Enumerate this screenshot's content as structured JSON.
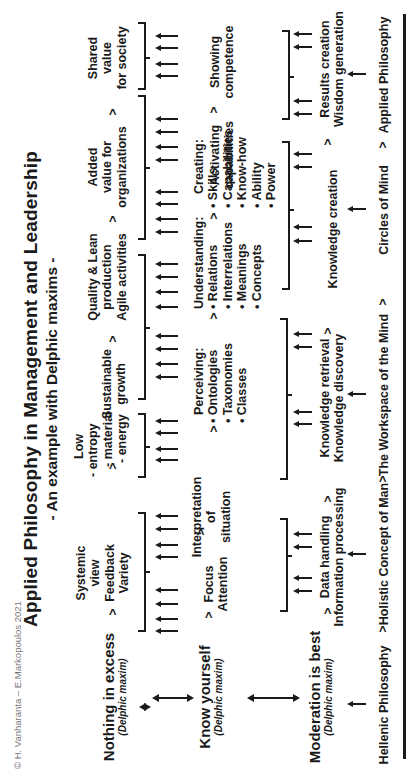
{
  "copyright": "© H. Vanharanta – E.Markopoulos 2021",
  "title": "Applied Philosophy in Management and Leadership",
  "subtitle": "- An example with Delphic maxims -",
  "separator": ">",
  "maxims": [
    {
      "label": "Nothing in excess",
      "sub": "(Delphic maxim)"
    },
    {
      "label": "Know yourself",
      "sub": "(Delphic maxim)"
    },
    {
      "label": "Moderation is best",
      "sub": "(Delphic maxim)"
    }
  ],
  "row1": {
    "items": [
      {
        "lines": [
          "Systemic",
          "view",
          "Feedback",
          "Variety"
        ]
      },
      {
        "lines": [
          "Low",
          "- entropy",
          "- material",
          "- energy"
        ]
      },
      {
        "lines": [
          "Sustainable",
          "growth"
        ]
      },
      {
        "lines": [
          "Quality & Lean",
          "production",
          "Agile activities"
        ]
      },
      {
        "lines": [
          "Added",
          "value for",
          "organizations"
        ]
      },
      {
        "lines": [
          "Shared",
          "value",
          "for society"
        ]
      }
    ]
  },
  "row2": {
    "items": [
      {
        "lines": [
          "Focus",
          "Attention"
        ]
      },
      {
        "lines": [
          "Interpretation",
          "of",
          "situation"
        ]
      },
      {
        "heading": "Perceiving:",
        "bullets": [
          "• Ontologies",
          "• Taxonomies",
          "• Classes"
        ]
      },
      {
        "heading": "Understanding:",
        "bullets": [
          "• Relations",
          "• Interrelations",
          "• Meanings",
          "• Concepts"
        ]
      },
      {
        "heading": "Creating:",
        "bullets": [
          "• Skills",
          "• Capabilities",
          "• Know-how",
          "• Ability",
          "• Power"
        ]
      },
      {
        "lines": [
          "Activating",
          "capabilities"
        ]
      },
      {
        "lines": [
          "Showing",
          "competence"
        ]
      }
    ]
  },
  "row3": {
    "items": [
      {
        "lines": [
          "Data handling",
          "Information processing"
        ]
      },
      {
        "lines": [
          "Knowledge retrieval",
          "Knowledge discovery"
        ]
      },
      {
        "lines": [
          "Knowledge creation"
        ]
      },
      {
        "lines": [
          "Results creation",
          "Wisdom generation"
        ]
      }
    ]
  },
  "bottom": {
    "items": [
      "Hellenic Philosophy",
      "Holistic Concept of Man",
      "The Workspace of the Mind",
      "Circles of Mind",
      "Applied Philosophy"
    ]
  }
}
